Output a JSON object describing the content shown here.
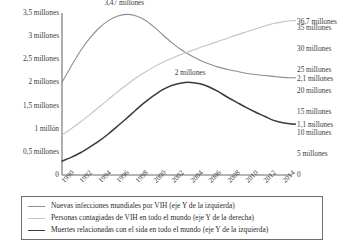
{
  "chart_data": {
    "type": "line",
    "title": "",
    "subtitle": "",
    "xlabel": "",
    "ylabel": "",
    "grid": false,
    "legend_position": "bottom",
    "x": [
      1990,
      1991,
      1992,
      1993,
      1994,
      1995,
      1996,
      1997,
      1998,
      1999,
      2000,
      2001,
      2002,
      2003,
      2004,
      2005,
      2006,
      2007,
      2008,
      2009,
      2010,
      2011,
      2012,
      2013,
      2014,
      2015
    ],
    "xtick_labels": [
      "1990",
      "1992",
      "1994",
      "1996",
      "1998",
      "2000",
      "2002",
      "2004",
      "2006",
      "2008",
      "2010",
      "2012",
      "2014"
    ],
    "left_axis": {
      "label": "",
      "ylim": [
        0,
        3.5
      ],
      "unit": "millones",
      "tick_labels": [
        "3,5 millones",
        "3 millones",
        "2,5 millones",
        "2 millones",
        "1,5 millones",
        "1 millón",
        "0,5 millones",
        "0"
      ],
      "tick_values": [
        3.5,
        3,
        2.5,
        2,
        1.5,
        1,
        0.5,
        0
      ]
    },
    "right_axis": {
      "label": "",
      "ylim": [
        0,
        38.5
      ],
      "unit": "millones",
      "tick_labels": [
        "35 millones",
        "30 millones",
        "25 millones",
        "20 millones",
        "15 millones",
        "10 millones",
        "5 millones",
        "0"
      ],
      "tick_values": [
        35,
        30,
        25,
        20,
        15,
        10,
        5,
        0
      ]
    },
    "series": [
      {
        "name": "Nuevas infecciones mundiales por VIH (eje Y de la izquierda)",
        "short_name": "Nuevas infecciones mundiales por VIH",
        "axis": "left",
        "color": "#8e8e8e",
        "width": 1.1,
        "values": [
          2.0,
          2.35,
          2.68,
          2.95,
          3.17,
          3.33,
          3.43,
          3.47,
          3.44,
          3.35,
          3.2,
          3.02,
          2.85,
          2.7,
          2.58,
          2.48,
          2.4,
          2.33,
          2.28,
          2.24,
          2.2,
          2.17,
          2.15,
          2.13,
          2.11,
          2.1
        ]
      },
      {
        "name": "Personas contagiadas de VIH en todo el mundo (eje Y de la derecha)",
        "short_name": "Personas contagiadas de VIH en todo el mundo",
        "axis": "right",
        "color": "#c4c4c4",
        "width": 1.1,
        "values": [
          9.5,
          11.0,
          12.6,
          14.3,
          16.1,
          17.9,
          19.7,
          21.4,
          23.0,
          24.4,
          25.7,
          26.8,
          27.8,
          28.7,
          29.5,
          30.3,
          31.0,
          31.8,
          32.5,
          33.3,
          34.0,
          34.7,
          35.4,
          36.0,
          36.4,
          36.7
        ]
      },
      {
        "name": "Muertes relacionadas con el sida en todo el mundo (eje Y de la izquierda)",
        "short_name": "Muertes relacionadas con el sida en todo el mundo",
        "axis": "left",
        "color": "#3a3a3a",
        "width": 1.5,
        "values": [
          0.3,
          0.38,
          0.48,
          0.6,
          0.73,
          0.88,
          1.05,
          1.22,
          1.4,
          1.57,
          1.72,
          1.85,
          1.94,
          1.99,
          2.0,
          1.97,
          1.9,
          1.8,
          1.68,
          1.57,
          1.46,
          1.36,
          1.27,
          1.18,
          1.13,
          1.1
        ]
      }
    ],
    "annotations": [
      {
        "text": "3,47 millones",
        "series": "Nuevas infecciones mundiales por VIH",
        "x": 1997,
        "value": 3.47
      },
      {
        "text": "2 millones",
        "series": "Muertes relacionadas con el sida en todo el mundo",
        "x": 2004,
        "value": 2.0
      },
      {
        "text": "36,7 millones",
        "series": "Personas contagiadas de VIH en todo el mundo",
        "x": 2015,
        "value": 36.7
      },
      {
        "text": "2,1 millones",
        "series": "Nuevas infecciones mundiales por VIH",
        "x": 2015,
        "value": 2.1
      },
      {
        "text": "1,1 millones",
        "series": "Muertes relacionadas con el sida en todo el mundo",
        "x": 2015,
        "value": 1.1
      }
    ]
  }
}
